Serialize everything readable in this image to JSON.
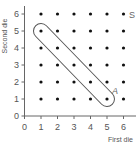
{
  "chart_data": {
    "type": "scatter",
    "title": "",
    "xlabel": "First die",
    "ylabel": "Second die",
    "xlim": [
      0,
      6
    ],
    "ylim": [
      0,
      6
    ],
    "x_ticks": [
      "0",
      "1",
      "2",
      "3",
      "4",
      "5",
      "6"
    ],
    "y_ticks": [
      "0",
      "1",
      "2",
      "3",
      "4",
      "5",
      "6"
    ],
    "grid": false,
    "sample_space_label": "S",
    "points": [
      [
        1,
        1
      ],
      [
        2,
        1
      ],
      [
        3,
        1
      ],
      [
        4,
        1
      ],
      [
        5,
        1
      ],
      [
        6,
        1
      ],
      [
        1,
        2
      ],
      [
        2,
        2
      ],
      [
        3,
        2
      ],
      [
        4,
        2
      ],
      [
        5,
        2
      ],
      [
        6,
        2
      ],
      [
        1,
        3
      ],
      [
        2,
        3
      ],
      [
        3,
        3
      ],
      [
        4,
        3
      ],
      [
        5,
        3
      ],
      [
        6,
        3
      ],
      [
        1,
        4
      ],
      [
        2,
        4
      ],
      [
        3,
        4
      ],
      [
        4,
        4
      ],
      [
        5,
        4
      ],
      [
        6,
        4
      ],
      [
        1,
        5
      ],
      [
        2,
        5
      ],
      [
        3,
        5
      ],
      [
        4,
        5
      ],
      [
        5,
        5
      ],
      [
        6,
        5
      ],
      [
        1,
        6
      ],
      [
        2,
        6
      ],
      [
        3,
        6
      ],
      [
        4,
        6
      ],
      [
        5,
        6
      ],
      [
        6,
        6
      ]
    ],
    "event": {
      "label": "A",
      "points": [
        [
          1,
          5
        ],
        [
          2,
          4
        ],
        [
          3,
          3
        ],
        [
          4,
          2
        ],
        [
          5,
          1
        ]
      ]
    }
  },
  "colors": {
    "axis": "#666666",
    "dot": "#111111",
    "outline": "#555555"
  }
}
